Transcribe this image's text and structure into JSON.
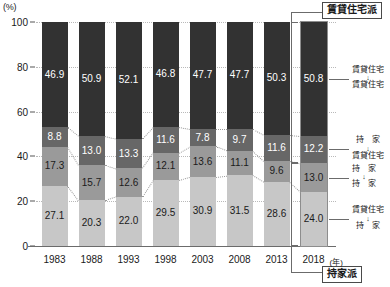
{
  "chart_data": {
    "type": "bar",
    "subtype": "stacked-bar-100",
    "title": "",
    "xlabel": "(年)",
    "ylabel": "(%)",
    "ylim": [
      0,
      100
    ],
    "yticks": [
      0,
      20,
      40,
      60,
      80,
      100
    ],
    "grid": true,
    "legend_position": "right",
    "categories": [
      "1983",
      "1988",
      "1993",
      "1998",
      "2003",
      "2008",
      "2013",
      "2018"
    ],
    "series": [
      {
        "name": "賃貸住宅→賃貸住宅",
        "short": "賃貸住宅",
        "color": "#323232",
        "values": [
          46.9,
          50.9,
          52.1,
          46.8,
          47.7,
          47.7,
          50.3,
          50.8
        ]
      },
      {
        "name": "持家→賃貸住宅",
        "short": "賃貸住宅",
        "color": "#676767",
        "values": [
          8.8,
          13.0,
          13.3,
          11.6,
          7.8,
          9.7,
          11.6,
          12.2
        ]
      },
      {
        "name": "持家→持家",
        "short": "持家",
        "color": "#9a9a9a",
        "values": [
          17.3,
          15.7,
          12.6,
          12.1,
          13.6,
          11.1,
          9.6,
          13.0
        ]
      },
      {
        "name": "賃貸住宅→持家",
        "short": "持家",
        "color": "#c7c7c7",
        "values": [
          27.1,
          20.3,
          22.0,
          29.5,
          30.9,
          31.5,
          28.6,
          24.0
        ]
      }
    ]
  },
  "axis": {
    "unit_label": "(%)",
    "x_unit_label": "(年)",
    "ticks": [
      "100",
      "80",
      "60",
      "40",
      "20",
      "0"
    ]
  },
  "callouts": {
    "top": "賃貸住宅派",
    "bottom": "持家派"
  },
  "annotations": [
    {
      "from": "賃貸住宅",
      "arrow": "↓",
      "to": "賃貸住宅"
    },
    {
      "from": "持　家",
      "arrow": "↓",
      "to": "賃貸住宅"
    },
    {
      "from": "持　家",
      "arrow": "↓",
      "to": "持　家"
    },
    {
      "from": "賃貸住宅",
      "arrow": "↓",
      "to": "持　家"
    }
  ]
}
